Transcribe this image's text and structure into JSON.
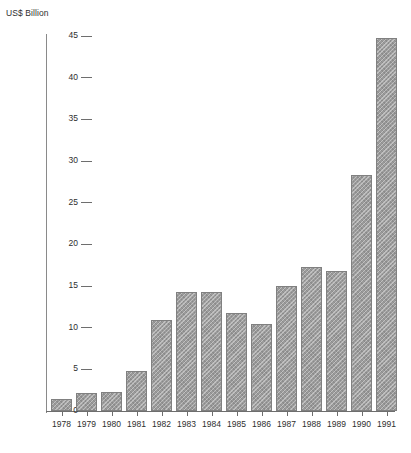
{
  "chart_data": {
    "type": "bar",
    "title": "",
    "subtitle": "",
    "xlabel": "",
    "ylabel": "US$ Billion",
    "categories": [
      "1978",
      "1979",
      "1980",
      "1981",
      "1982",
      "1983",
      "1984",
      "1985",
      "1986",
      "1987",
      "1988",
      "1989",
      "1990",
      "1991"
    ],
    "values": [
      1.5,
      2.2,
      2.3,
      4.8,
      10.9,
      14.3,
      14.3,
      11.8,
      10.4,
      15.0,
      17.3,
      16.8,
      28.3,
      44.8
    ],
    "ylim": [
      0,
      45
    ],
    "ytick_values": [
      0,
      5,
      10,
      15,
      20,
      25,
      30,
      35,
      40,
      45
    ],
    "ytick_labels": [
      "0",
      "5",
      "10",
      "15",
      "20",
      "25",
      "30",
      "35",
      "40",
      "45"
    ],
    "grid": false,
    "legend": null,
    "legend_position": "none",
    "annotations": [],
    "series": [
      {
        "name": "US$ Billion",
        "values": [
          1.5,
          2.2,
          2.3,
          4.8,
          10.9,
          14.3,
          14.3,
          11.8,
          10.4,
          15.0,
          17.3,
          16.8,
          28.3,
          44.8
        ]
      }
    ],
    "colors": {
      "bar_fill": "#9b9b9b",
      "bar_border": "#808080",
      "axis": "#6e6e6e",
      "text": "#2e2e2e",
      "background": "#ffffff"
    }
  }
}
